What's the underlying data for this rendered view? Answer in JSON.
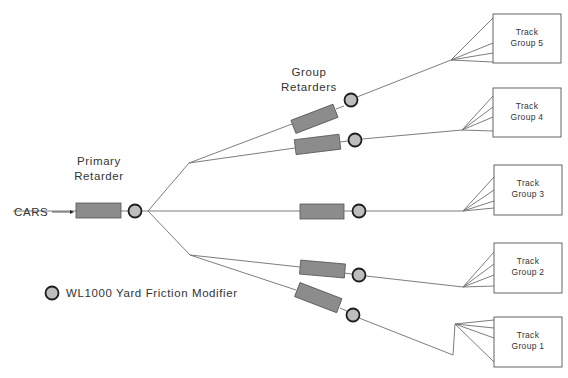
{
  "diagram": {
    "labels": {
      "cars": "CARS",
      "primary_retarder_line1": "Primary",
      "primary_retarder_line2": "Retarder",
      "group_retarders_line1": "Group",
      "group_retarders_line2": "Retarders"
    },
    "legend": {
      "symbol": "circle-gray",
      "label": "WL1000 Yard Friction Modifier"
    },
    "track_groups": [
      {
        "id": 5,
        "line1": "Track",
        "line2": "Group 5"
      },
      {
        "id": 4,
        "line1": "Track",
        "line2": "Group 4"
      },
      {
        "id": 3,
        "line1": "Track",
        "line2": "Group 3"
      },
      {
        "id": 2,
        "line1": "Track",
        "line2": "Group 2"
      },
      {
        "id": 1,
        "line1": "Track",
        "line2": "Group 1"
      }
    ],
    "colors": {
      "retarder_fill": "#8c8c8c",
      "friction_modifier_fill": "#bdbdbd",
      "line": "#6e6e6e",
      "text": "#333333"
    }
  }
}
